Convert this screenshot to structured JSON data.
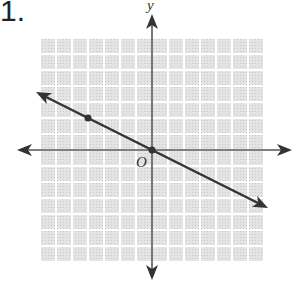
{
  "problem_number": "1.",
  "chart_data": {
    "type": "line",
    "title": "",
    "xlabel": "",
    "ylabel": "y",
    "origin_label": "O",
    "grid": true,
    "xlim": [
      -7,
      7
    ],
    "ylim": [
      -7,
      7
    ],
    "series": [
      {
        "name": "line",
        "slope": -0.5,
        "intercept": 0,
        "x": [
          -7,
          7
        ],
        "y": [
          3.5,
          -3.5
        ],
        "arrows": "both"
      }
    ],
    "points": [
      {
        "x": -4,
        "y": 2
      },
      {
        "x": 0,
        "y": 0
      }
    ]
  }
}
